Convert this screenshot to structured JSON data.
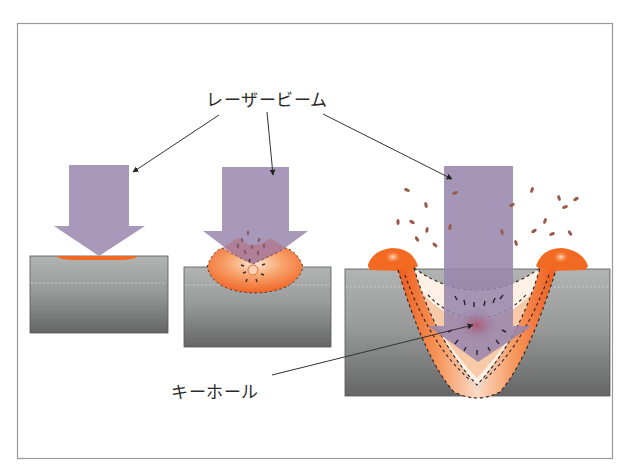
{
  "figure": {
    "frame": {
      "x": 17,
      "y": 23,
      "w": 596,
      "h": 436,
      "stroke": "#9a9a9a"
    },
    "labels": {
      "laser_beam": "レーザービーム",
      "keyhole": "キーホール"
    },
    "colors": {
      "beam": "#a898ba",
      "beam_dark": "#9886ad",
      "metal_top": "#b0b2b2",
      "metal_bottom": "#676767",
      "melt_orange": "#f26a21",
      "melt_light": "#fbd6b8",
      "spatter": "#9a5a48",
      "leader_line": "#333333"
    },
    "stages": [
      {
        "name": "heat-conduction",
        "description": "surface heating"
      },
      {
        "name": "melting",
        "description": "melt pool forming"
      },
      {
        "name": "keyhole",
        "description": "keyhole welding with spatter"
      }
    ]
  }
}
